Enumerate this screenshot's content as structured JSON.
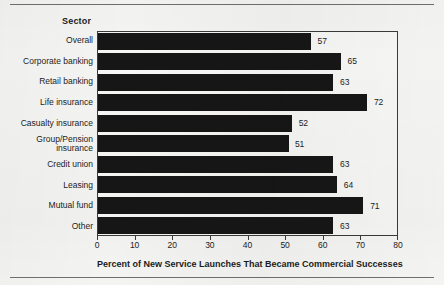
{
  "figure": {
    "sector_heading": "Sector",
    "axis_title": "Percent of New Service Launches That Became Commercial Successes",
    "bar_color": "#161616",
    "background_color": "#f4f4f2",
    "frame_color": "#3a3a3a",
    "text_color": "#1c1c1c"
  },
  "chart_data": {
    "type": "bar",
    "orientation": "horizontal",
    "title": "",
    "subtitle": "",
    "xlabel": "Percent of New Service Launches That Became Commercial Successes",
    "ylabel": "Sector",
    "xlim": [
      0,
      80
    ],
    "xticks": [
      0,
      10,
      20,
      30,
      40,
      50,
      60,
      70,
      80
    ],
    "xtick_labels": [
      "0",
      "10",
      "20",
      "30",
      "40",
      "50",
      "60",
      "70",
      "80"
    ],
    "grid": false,
    "legend": false,
    "legend_position": "none",
    "categories": [
      "Overall",
      "Corporate banking",
      "Retail banking",
      "Life insurance",
      "Casualty insurance",
      "Group/Pension\ninsurance",
      "Credit union",
      "Leasing",
      "Mutual fund",
      "Other"
    ],
    "values": [
      57,
      65,
      63,
      72,
      52,
      51,
      63,
      64,
      71,
      63
    ],
    "data_labels": [
      "57",
      "65",
      "63",
      "72",
      "52",
      "51",
      "63",
      "64",
      "71",
      "63"
    ]
  }
}
